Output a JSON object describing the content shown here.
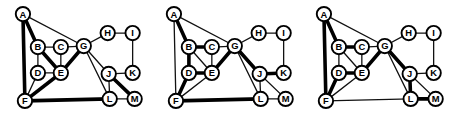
{
  "figure": {
    "title": "",
    "colors": {
      "background": "#ffffff",
      "node_fill": "#ffffff",
      "node_stroke": "#000000",
      "edge_thin": "#111111",
      "edge_thick": "#000000"
    },
    "node_radius": 7.2,
    "thin_width": 1.3,
    "thick_width": 3.6
  },
  "chart_data": {
    "type": "diagram",
    "xlabel": "",
    "ylabel": "",
    "legend": [
      {
        "name": "thin edge",
        "style": "thin"
      },
      {
        "name": "thick edge",
        "style": "thick"
      }
    ],
    "nodes": [
      {
        "id": "A",
        "label": "A",
        "x": 23,
        "y": 14
      },
      {
        "id": "B",
        "label": "B",
        "x": 38,
        "y": 47
      },
      {
        "id": "C",
        "label": "C",
        "x": 61,
        "y": 47
      },
      {
        "id": "D",
        "label": "D",
        "x": 38,
        "y": 73
      },
      {
        "id": "E",
        "label": "E",
        "x": 61,
        "y": 73
      },
      {
        "id": "F",
        "label": "F",
        "x": 25,
        "y": 101
      },
      {
        "id": "G",
        "label": "G",
        "x": 84,
        "y": 46
      },
      {
        "id": "H",
        "label": "H",
        "x": 108,
        "y": 33
      },
      {
        "id": "I",
        "label": "I",
        "x": 133,
        "y": 33
      },
      {
        "id": "J",
        "label": "J",
        "x": 109,
        "y": 74
      },
      {
        "id": "K",
        "label": "K",
        "x": 133,
        "y": 73
      },
      {
        "id": "L",
        "label": "L",
        "x": 110,
        "y": 99
      },
      {
        "id": "M",
        "label": "M",
        "x": 135,
        "y": 99
      }
    ],
    "base_edges": [
      [
        "A",
        "B"
      ],
      [
        "A",
        "G"
      ],
      [
        "A",
        "F"
      ],
      [
        "B",
        "C"
      ],
      [
        "B",
        "D"
      ],
      [
        "B",
        "E"
      ],
      [
        "C",
        "E"
      ],
      [
        "C",
        "G"
      ],
      [
        "D",
        "E"
      ],
      [
        "D",
        "F"
      ],
      [
        "E",
        "F"
      ],
      [
        "E",
        "G"
      ],
      [
        "F",
        "L"
      ],
      [
        "G",
        "H"
      ],
      [
        "G",
        "J"
      ],
      [
        "G",
        "L"
      ],
      [
        "H",
        "I"
      ],
      [
        "I",
        "K"
      ],
      [
        "J",
        "K"
      ],
      [
        "J",
        "L"
      ],
      [
        "J",
        "M"
      ],
      [
        "L",
        "M"
      ]
    ],
    "panels": [
      {
        "name": "panel-1",
        "caption": "",
        "thick_edges": [
          [
            "A",
            "B"
          ],
          [
            "A",
            "F"
          ],
          [
            "B",
            "E"
          ],
          [
            "E",
            "F"
          ],
          [
            "E",
            "G"
          ],
          [
            "F",
            "L"
          ],
          [
            "J",
            "M"
          ]
        ]
      },
      {
        "name": "panel-2",
        "caption": "",
        "thick_edges": [
          [
            "A",
            "B"
          ],
          [
            "B",
            "C"
          ],
          [
            "B",
            "D"
          ],
          [
            "D",
            "E"
          ],
          [
            "D",
            "F"
          ],
          [
            "E",
            "G"
          ],
          [
            "F",
            "L"
          ],
          [
            "G",
            "J"
          ],
          [
            "J",
            "K"
          ]
        ]
      },
      {
        "name": "panel-3",
        "caption": "",
        "thick_edges": [
          [
            "A",
            "B"
          ],
          [
            "A",
            "F"
          ],
          [
            "B",
            "C"
          ],
          [
            "D",
            "E"
          ],
          [
            "D",
            "F"
          ],
          [
            "E",
            "G"
          ],
          [
            "G",
            "J"
          ],
          [
            "J",
            "L"
          ],
          [
            "L",
            "M"
          ]
        ]
      }
    ]
  }
}
